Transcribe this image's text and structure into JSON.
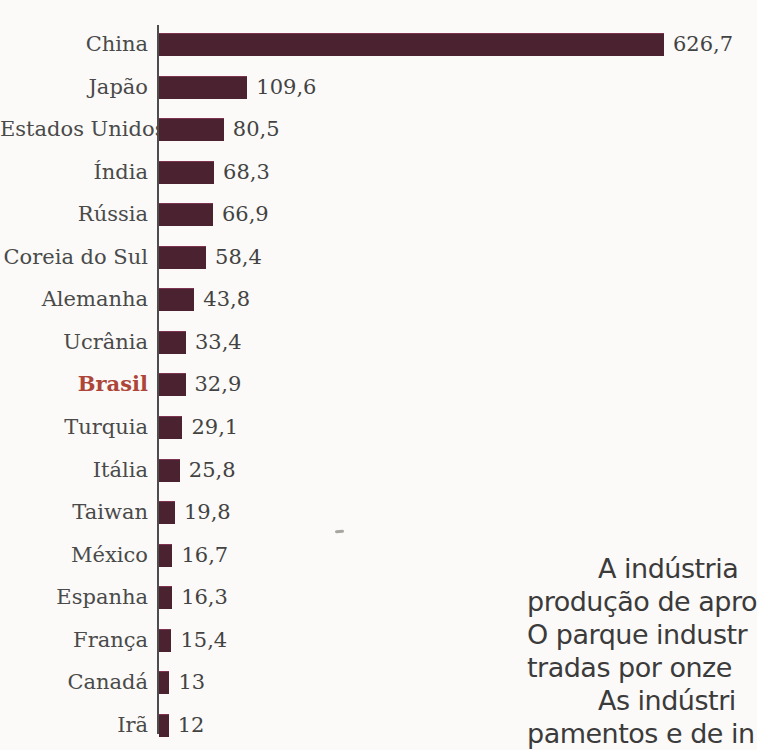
{
  "colors": {
    "background": "#fbfaf8",
    "bar": "#4a2230",
    "axis": "#4d4d4d",
    "country_label": "#4a4a4a",
    "value_label": "#434343",
    "body_text": "#3b3b3b",
    "highlight_label": "#ad4639"
  },
  "chart_data": {
    "type": "bar",
    "orientation": "horizontal",
    "categories": [
      "China",
      "Japão",
      "Estados Unidos",
      "Índia",
      "Rússia",
      "Coreia do Sul",
      "Alemanha",
      "Ucrânia",
      "Brasil",
      "Turquia",
      "Itália",
      "Taiwan",
      "México",
      "Espanha",
      "França",
      "Canadá",
      "Irã"
    ],
    "values": [
      626.7,
      109.6,
      80.5,
      68.3,
      66.9,
      58.4,
      43.8,
      33.4,
      32.9,
      29.1,
      25.8,
      19.8,
      16.7,
      16.3,
      15.4,
      13,
      12
    ],
    "value_labels": [
      "626,7",
      "109,6",
      "80,5",
      "68,3",
      "66,9",
      "58,4",
      "43,8",
      "33,4",
      "32,9",
      "29,1",
      "25,8",
      "19,8",
      "16,7",
      "16,3",
      "15,4",
      "13",
      "12"
    ],
    "highlighted_category": "Brasil",
    "xlim": [
      0,
      640
    ],
    "grid": false,
    "legend": false
  },
  "paragraph": {
    "lines": [
      {
        "text": "A indústria",
        "indent": true
      },
      {
        "text": "produção de apro",
        "indent": false
      },
      {
        "text": "O parque industr",
        "indent": false
      },
      {
        "text": "tradas por onze",
        "indent": false
      },
      {
        "text": "As indústri",
        "indent": true
      },
      {
        "text": "pamentos e de in",
        "indent": false
      }
    ]
  }
}
